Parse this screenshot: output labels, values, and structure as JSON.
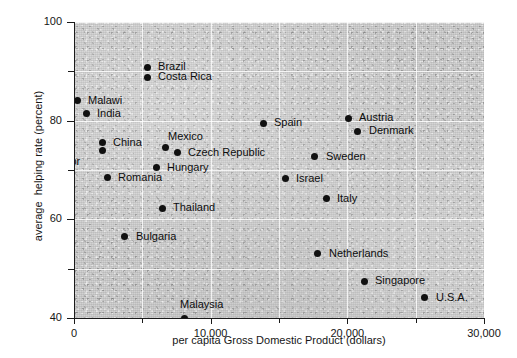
{
  "chart_data": {
    "type": "scatter",
    "title": "",
    "xlabel": "per capita Gross Domestic Product (dollars)",
    "ylabel": "average  helping rate (percent)",
    "xlim": [
      0,
      30000
    ],
    "ylim": [
      40,
      100
    ],
    "xticks": [
      0,
      10000,
      20000,
      30000
    ],
    "xtick_labels": [
      "0",
      "10,000",
      "20,000",
      "30,000"
    ],
    "xminor_ticks": [
      5000,
      15000,
      25000
    ],
    "yticks": [
      40,
      60,
      80,
      100
    ],
    "ytick_labels": [
      "40",
      "60",
      "80",
      "100"
    ],
    "yminor_ticks": [
      50,
      70,
      90
    ],
    "grid": true,
    "grid_color": "#ffffff",
    "point_color": "#111111",
    "plot_background": "#c9c9c9",
    "legend": "none",
    "points": [
      {
        "label": "Brazil",
        "x": 5350,
        "y": 90.8,
        "lx": 11,
        "ly": -6
      },
      {
        "label": "Costa Rica",
        "x": 5350,
        "y": 88.8,
        "lx": 11,
        "ly": -6
      },
      {
        "label": "Malawi",
        "x": 220,
        "y": 84.0,
        "lx": 11,
        "ly": -6
      },
      {
        "label": "India",
        "x": 880,
        "y": 81.4,
        "lx": 11,
        "ly": -6
      },
      {
        "label": "China",
        "x": 2050,
        "y": 75.5,
        "lx": 11,
        "ly": -6
      },
      {
        "label": "El Salvador",
        "x": 2050,
        "y": 73.9,
        "lx": -78,
        "ly": 5
      },
      {
        "label": "Mexico",
        "x": 6730,
        "y": 74.5,
        "lx": 2,
        "ly": -17
      },
      {
        "label": "Czech Republic",
        "x": 7540,
        "y": 73.5,
        "lx": 11,
        "ly": -6
      },
      {
        "label": "Hungary",
        "x": 6000,
        "y": 70.5,
        "lx": 11,
        "ly": -6
      },
      {
        "label": "Romania",
        "x": 2420,
        "y": 68.4,
        "lx": 11,
        "ly": -6
      },
      {
        "label": "Spain",
        "x": 13830,
        "y": 79.5,
        "lx": 11,
        "ly": -6
      },
      {
        "label": "Austria",
        "x": 20050,
        "y": 80.5,
        "lx": 11,
        "ly": -6
      },
      {
        "label": "Denmark",
        "x": 20780,
        "y": 77.9,
        "lx": 11,
        "ly": -6
      },
      {
        "label": "Sweden",
        "x": 17630,
        "y": 72.7,
        "lx": 11,
        "ly": -6
      },
      {
        "label": "Israel",
        "x": 15440,
        "y": 68.2,
        "lx": 11,
        "ly": -6
      },
      {
        "label": "Italy",
        "x": 18440,
        "y": 64.2,
        "lx": 11,
        "ly": -6
      },
      {
        "label": "Thailand",
        "x": 6440,
        "y": 62.2,
        "lx": 11,
        "ly": -6
      },
      {
        "label": "Bulgaria",
        "x": 3730,
        "y": 56.5,
        "lx": 11,
        "ly": -6
      },
      {
        "label": "Netherlands",
        "x": 17850,
        "y": 53.0,
        "lx": 11,
        "ly": -6
      },
      {
        "label": "Singapore",
        "x": 21220,
        "y": 47.5,
        "lx": 11,
        "ly": -6
      },
      {
        "label": "U.S.A.",
        "x": 25680,
        "y": 44.1,
        "lx": 11,
        "ly": -6
      },
      {
        "label": "Malaysia",
        "x": 8050,
        "y": 40.0,
        "lx": -4,
        "ly": -19
      }
    ]
  }
}
